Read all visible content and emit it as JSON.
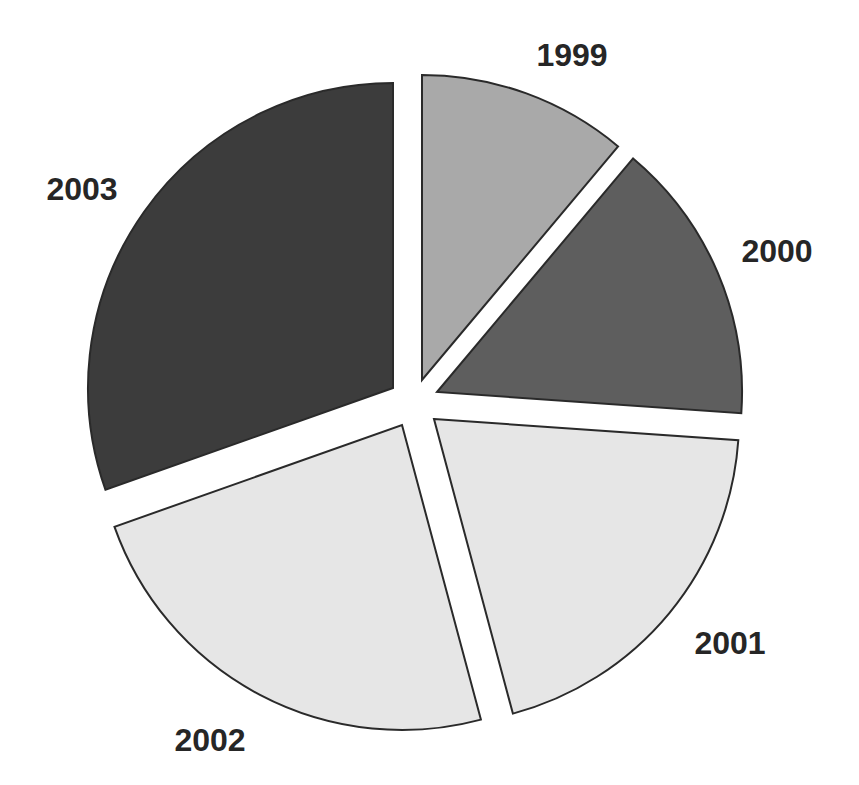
{
  "chart_data": {
    "type": "pie",
    "title": "",
    "categories": [
      "1999",
      "2000",
      "2001",
      "2002",
      "2003"
    ],
    "values": [
      11,
      15,
      20,
      24,
      30
    ],
    "unit": "percent (estimated from slice angles)",
    "exploded": true,
    "start_angle_deg": 0,
    "direction": "clockwise",
    "colors": [
      "#a9a9a9",
      "#5e5e5e",
      "#e6e6e6",
      "#e6e6e6",
      "#3c3c3c"
    ],
    "outline_color": "#2a2a2a",
    "legend": "none (data labels outside slices)",
    "slices": [
      {
        "label": "1999",
        "value": 11,
        "start": 0,
        "end": 40,
        "apex": [
          422,
          380
        ],
        "color": "#a9a9a9",
        "label_pos": [
          572,
          66
        ]
      },
      {
        "label": "2000",
        "value": 15,
        "start": 40,
        "end": 94,
        "apex": [
          437,
          392
        ],
        "color": "#5e5e5e",
        "label_pos": [
          777,
          262
        ]
      },
      {
        "label": "2001",
        "value": 20,
        "start": 94,
        "end": 165,
        "apex": [
          434,
          419
        ],
        "color": "#e6e6e6",
        "label_pos": [
          730,
          654
        ]
      },
      {
        "label": "2002",
        "value": 24,
        "start": 165,
        "end": 250.5,
        "apex": [
          402,
          425
        ],
        "color": "#e6e6e6",
        "label_pos": [
          210,
          751
        ]
      },
      {
        "label": "2003",
        "value": 30,
        "start": 250.5,
        "end": 360,
        "apex": [
          393,
          388
        ],
        "color": "#3c3c3c",
        "label_pos": [
          82,
          200
        ]
      }
    ],
    "radius": 305
  }
}
